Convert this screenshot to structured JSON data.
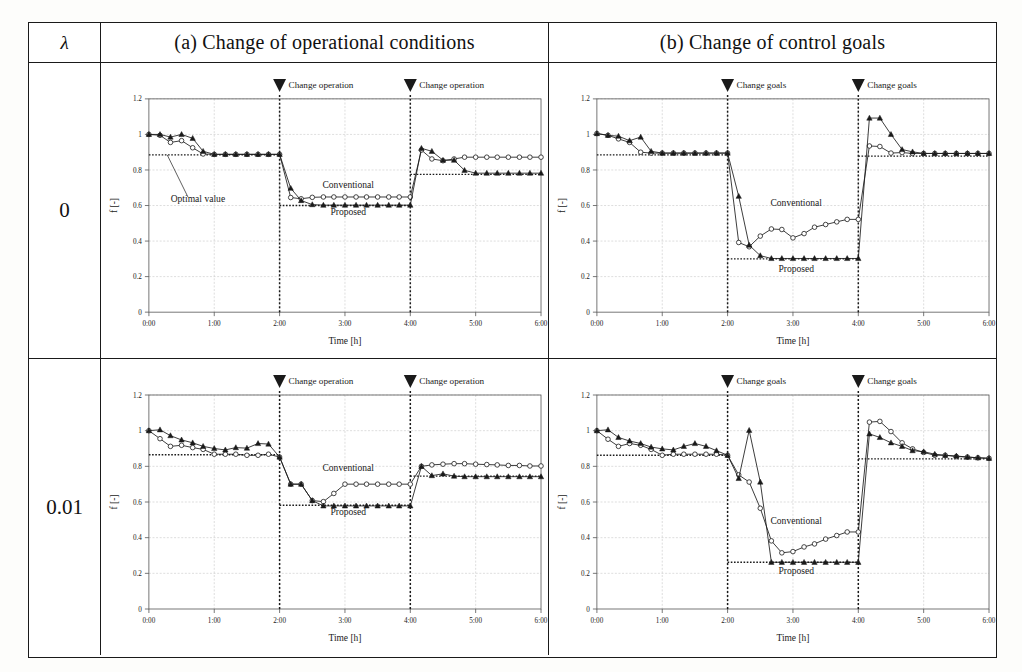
{
  "figure": {
    "lambda_header": "λ",
    "columns": [
      {
        "key": "a",
        "title": "(a) Change of operational conditions"
      },
      {
        "key": "b",
        "title": "(b) Change of control goals"
      }
    ],
    "rows": [
      {
        "key": "r0",
        "lambda": "0"
      },
      {
        "key": "r001",
        "lambda": "0.01"
      }
    ],
    "colors": {
      "line": "#1a1a1a",
      "grid": "#bdbdbd",
      "axis": "#555555",
      "paper": "#ffffff"
    }
  },
  "chart_data": [
    {
      "id": "a0",
      "type": "line",
      "panel": "(a) Change of operational conditions",
      "lambda": "0",
      "xlabel": "Time [h]",
      "ylabel": "f [-]",
      "xlim": [
        0,
        6
      ],
      "ylim": [
        0,
        1.2
      ],
      "xticks": [
        "0:00",
        "1:00",
        "2:00",
        "3:00",
        "4:00",
        "5:00",
        "6:00"
      ],
      "yticks": [
        "0",
        "0.2",
        "0.4",
        "0.6",
        "0.8",
        "1",
        "1.2"
      ],
      "grid": true,
      "events": [
        {
          "x": 2.0,
          "label": "Change operation"
        },
        {
          "x": 4.0,
          "label": "Change operation"
        }
      ],
      "annotations": [
        {
          "text": "Optimal value",
          "x": 0.75,
          "y": 0.62,
          "leader_to": [
            0.28,
            0.885
          ]
        },
        {
          "text": "Conventional",
          "x": 3.05,
          "y": 0.7
        },
        {
          "text": "Proposed",
          "x": 3.05,
          "y": 0.545
        }
      ],
      "optimal_segments": [
        {
          "x0": 0.0,
          "x1": 2.0,
          "y": 0.885
        },
        {
          "x0": 2.0,
          "x1": 4.0,
          "y": 0.6
        },
        {
          "x0": 4.0,
          "x1": 6.0,
          "y": 0.775
        }
      ],
      "x": [
        0.0,
        0.17,
        0.33,
        0.5,
        0.67,
        0.83,
        1.0,
        1.17,
        1.33,
        1.5,
        1.67,
        1.83,
        2.0,
        2.17,
        2.33,
        2.5,
        2.67,
        2.83,
        3.0,
        3.17,
        3.33,
        3.5,
        3.67,
        3.83,
        4.0,
        4.17,
        4.33,
        4.5,
        4.67,
        4.83,
        5.0,
        5.17,
        5.33,
        5.5,
        5.67,
        5.83,
        6.0
      ],
      "series": [
        {
          "name": "Conventional",
          "marker": "open-circle",
          "values": [
            1.0,
            0.995,
            0.955,
            0.965,
            0.925,
            0.89,
            0.888,
            0.888,
            0.888,
            0.888,
            0.888,
            0.888,
            0.888,
            0.645,
            0.638,
            0.646,
            0.648,
            0.648,
            0.648,
            0.648,
            0.648,
            0.648,
            0.648,
            0.648,
            0.648,
            0.912,
            0.862,
            0.852,
            0.862,
            0.872,
            0.872,
            0.872,
            0.872,
            0.872,
            0.872,
            0.872,
            0.872
          ]
        },
        {
          "name": "Proposed",
          "marker": "filled-triangle",
          "values": [
            1.0,
            1.0,
            0.985,
            1.0,
            0.978,
            0.905,
            0.888,
            0.888,
            0.888,
            0.888,
            0.888,
            0.888,
            0.888,
            0.697,
            0.628,
            0.605,
            0.602,
            0.602,
            0.602,
            0.602,
            0.602,
            0.602,
            0.602,
            0.602,
            0.602,
            0.922,
            0.905,
            0.855,
            0.855,
            0.798,
            0.782,
            0.782,
            0.782,
            0.782,
            0.782,
            0.782,
            0.782
          ]
        }
      ]
    },
    {
      "id": "b0",
      "type": "line",
      "panel": "(b) Change of control goals",
      "lambda": "0",
      "xlabel": "Time [h]",
      "ylabel": "f [-]",
      "xlim": [
        0,
        6
      ],
      "ylim": [
        0,
        1.2
      ],
      "xticks": [
        "0:00",
        "1:00",
        "2:00",
        "3:00",
        "4:00",
        "5:00",
        "6:00"
      ],
      "yticks": [
        "0",
        "0.2",
        "0.4",
        "0.6",
        "0.8",
        "1",
        "1.2"
      ],
      "grid": true,
      "events": [
        {
          "x": 2.0,
          "label": "Change goals"
        },
        {
          "x": 4.0,
          "label": "Change goals"
        }
      ],
      "annotations": [
        {
          "text": "Conventional",
          "x": 3.05,
          "y": 0.6
        },
        {
          "text": "Proposed",
          "x": 3.05,
          "y": 0.225
        }
      ],
      "optimal_segments": [
        {
          "x0": 0.0,
          "x1": 2.0,
          "y": 0.885
        },
        {
          "x0": 2.0,
          "x1": 4.0,
          "y": 0.3
        },
        {
          "x0": 4.0,
          "x1": 6.0,
          "y": 0.878
        }
      ],
      "x": [
        0.0,
        0.17,
        0.33,
        0.5,
        0.67,
        0.83,
        1.0,
        1.17,
        1.33,
        1.5,
        1.67,
        1.83,
        2.0,
        2.17,
        2.33,
        2.5,
        2.67,
        2.83,
        3.0,
        3.17,
        3.33,
        3.5,
        3.67,
        3.83,
        4.0,
        4.17,
        4.33,
        4.5,
        4.67,
        4.83,
        5.0,
        5.17,
        5.33,
        5.5,
        5.67,
        5.83,
        6.0
      ],
      "series": [
        {
          "name": "Conventional",
          "marker": "open-circle",
          "values": [
            1.005,
            0.995,
            0.975,
            0.955,
            0.9,
            0.895,
            0.895,
            0.895,
            0.895,
            0.895,
            0.895,
            0.895,
            0.895,
            0.392,
            0.368,
            0.428,
            0.468,
            0.465,
            0.418,
            0.442,
            0.478,
            0.493,
            0.508,
            0.522,
            0.522,
            0.935,
            0.932,
            0.895,
            0.898,
            0.893,
            0.893,
            0.893,
            0.893,
            0.893,
            0.893,
            0.893,
            0.893
          ],
          "break_at_events": true
        },
        {
          "name": "Proposed",
          "marker": "filled-triangle",
          "values": [
            1.005,
            0.995,
            0.99,
            0.965,
            0.985,
            0.905,
            0.895,
            0.895,
            0.895,
            0.895,
            0.895,
            0.895,
            0.895,
            0.652,
            0.377,
            0.318,
            0.302,
            0.302,
            0.302,
            0.302,
            0.302,
            0.302,
            0.302,
            0.302,
            0.302,
            1.092,
            1.092,
            1.0,
            0.915,
            0.902,
            0.893,
            0.893,
            0.893,
            0.893,
            0.893,
            0.893,
            0.893
          ],
          "break_at_events": true
        }
      ]
    },
    {
      "id": "a001",
      "type": "line",
      "panel": "(a) Change of operational conditions",
      "lambda": "0.01",
      "xlabel": "Time [h]",
      "ylabel": "f [-]",
      "xlim": [
        0,
        6
      ],
      "ylim": [
        0,
        1.2
      ],
      "xticks": [
        "0:00",
        "1:00",
        "2:00",
        "3:00",
        "4:00",
        "5:00",
        "6:00"
      ],
      "yticks": [
        "0",
        "0.2",
        "0.4",
        "0.6",
        "0.8",
        "1",
        "1.2"
      ],
      "grid": true,
      "events": [
        {
          "x": 2.0,
          "label": "Change operation"
        },
        {
          "x": 4.0,
          "label": "Change operation"
        }
      ],
      "annotations": [
        {
          "text": "Conventional",
          "x": 3.05,
          "y": 0.775
        },
        {
          "text": "Proposed",
          "x": 3.05,
          "y": 0.525
        }
      ],
      "optimal_segments": [
        {
          "x0": 0.0,
          "x1": 2.0,
          "y": 0.865
        },
        {
          "x0": 2.0,
          "x1": 4.0,
          "y": 0.582
        },
        {
          "x0": 4.0,
          "x1": 6.0,
          "y": 0.745
        }
      ],
      "x": [
        0.0,
        0.17,
        0.33,
        0.5,
        0.67,
        0.83,
        1.0,
        1.17,
        1.33,
        1.5,
        1.67,
        1.83,
        2.0,
        2.17,
        2.33,
        2.5,
        2.67,
        2.83,
        3.0,
        3.17,
        3.33,
        3.5,
        3.67,
        3.83,
        4.0,
        4.17,
        4.33,
        4.5,
        4.67,
        4.83,
        5.0,
        5.17,
        5.33,
        5.5,
        5.67,
        5.83,
        6.0
      ],
      "series": [
        {
          "name": "Conventional",
          "marker": "open-circle",
          "values": [
            1.0,
            0.955,
            0.912,
            0.918,
            0.905,
            0.895,
            0.868,
            0.868,
            0.868,
            0.862,
            0.862,
            0.868,
            0.852,
            0.7,
            0.7,
            0.608,
            0.602,
            0.648,
            0.7,
            0.7,
            0.7,
            0.7,
            0.7,
            0.7,
            0.7,
            0.8,
            0.808,
            0.812,
            0.815,
            0.815,
            0.812,
            0.81,
            0.808,
            0.805,
            0.805,
            0.802,
            0.802
          ]
        },
        {
          "name": "Proposed",
          "marker": "filled-triangle",
          "values": [
            1.0,
            1.005,
            0.972,
            0.948,
            0.932,
            0.912,
            0.9,
            0.892,
            0.905,
            0.902,
            0.928,
            0.925,
            0.852,
            0.7,
            0.7,
            0.608,
            0.578,
            0.578,
            0.578,
            0.578,
            0.578,
            0.578,
            0.578,
            0.578,
            0.578,
            0.8,
            0.748,
            0.758,
            0.745,
            0.742,
            0.742,
            0.742,
            0.742,
            0.742,
            0.742,
            0.742,
            0.742
          ]
        }
      ]
    },
    {
      "id": "b001",
      "type": "line",
      "panel": "(b) Change of control goals",
      "lambda": "0.01",
      "xlabel": "Time [h]",
      "ylabel": "f [-]",
      "xlim": [
        0,
        6
      ],
      "ylim": [
        0,
        1.2
      ],
      "xticks": [
        "0:00",
        "1:00",
        "2:00",
        "3:00",
        "4:00",
        "5:00",
        "6:00"
      ],
      "yticks": [
        "0",
        "0.2",
        "0.4",
        "0.6",
        "0.8",
        "1",
        "1.2"
      ],
      "grid": true,
      "events": [
        {
          "x": 2.0,
          "label": "Change goals"
        },
        {
          "x": 4.0,
          "label": "Change goals"
        }
      ],
      "annotations": [
        {
          "text": "Conventional",
          "x": 3.05,
          "y": 0.475
        },
        {
          "text": "Proposed",
          "x": 3.05,
          "y": 0.195
        }
      ],
      "optimal_segments": [
        {
          "x0": 0.0,
          "x1": 2.0,
          "y": 0.862
        },
        {
          "x0": 2.0,
          "x1": 4.0,
          "y": 0.262
        },
        {
          "x0": 4.0,
          "x1": 6.0,
          "y": 0.842
        }
      ],
      "x": [
        0.0,
        0.17,
        0.33,
        0.5,
        0.67,
        0.83,
        1.0,
        1.17,
        1.33,
        1.5,
        1.67,
        1.83,
        2.0,
        2.17,
        2.33,
        2.5,
        2.67,
        2.83,
        3.0,
        3.17,
        3.33,
        3.5,
        3.67,
        3.83,
        4.0,
        4.17,
        4.33,
        4.5,
        4.67,
        4.83,
        5.0,
        5.17,
        5.33,
        5.5,
        5.67,
        5.83,
        6.0
      ],
      "series": [
        {
          "name": "Conventional",
          "marker": "open-circle",
          "values": [
            1.0,
            0.952,
            0.912,
            0.928,
            0.918,
            0.895,
            0.862,
            0.868,
            0.868,
            0.868,
            0.868,
            0.868,
            0.862,
            0.752,
            0.712,
            0.565,
            0.382,
            0.315,
            0.322,
            0.348,
            0.365,
            0.392,
            0.412,
            0.432,
            0.432,
            1.048,
            1.052,
            0.995,
            0.932,
            0.898,
            0.878,
            0.862,
            0.862,
            0.855,
            0.852,
            0.848,
            0.845
          ],
          "break_at_events": true
        },
        {
          "name": "Proposed",
          "marker": "filled-triangle",
          "values": [
            1.0,
            1.005,
            0.962,
            0.942,
            0.928,
            0.908,
            0.898,
            0.892,
            0.912,
            0.928,
            0.912,
            0.888,
            0.862,
            0.732,
            1.002,
            0.712,
            0.262,
            0.262,
            0.262,
            0.262,
            0.262,
            0.262,
            0.262,
            0.262,
            0.262,
            0.982,
            0.962,
            0.932,
            0.912,
            0.888,
            0.882,
            0.868,
            0.862,
            0.858,
            0.852,
            0.848,
            0.845
          ],
          "break_at_events": true
        }
      ]
    }
  ]
}
